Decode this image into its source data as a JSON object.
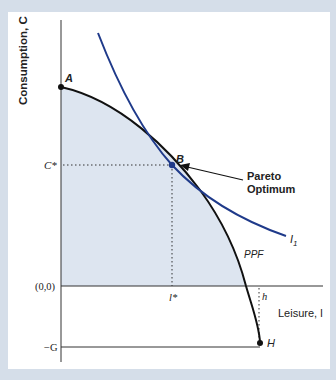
{
  "figure": {
    "y_axis_label": "Consumption, C",
    "x_axis_label": "Leisure, l",
    "origin_label": "(0,0)",
    "c_star_label": "C*",
    "neg_g_label": "−G",
    "l_star_label": "l*",
    "h_label": "h",
    "point_a_label": "A",
    "point_b_label": "B",
    "point_h_label": "H",
    "ppf_label": "PPF",
    "indifference_label": "I",
    "indifference_subscript": "1",
    "annotation_line1": "Pareto",
    "annotation_line2": "Optimum"
  },
  "colors": {
    "background": "#d5dee9",
    "panel": "#ffffff",
    "shade": "#dde5f0",
    "ppf": "#111111",
    "indifference": "#1f3a8a",
    "point_b": "#1f3a8a"
  }
}
